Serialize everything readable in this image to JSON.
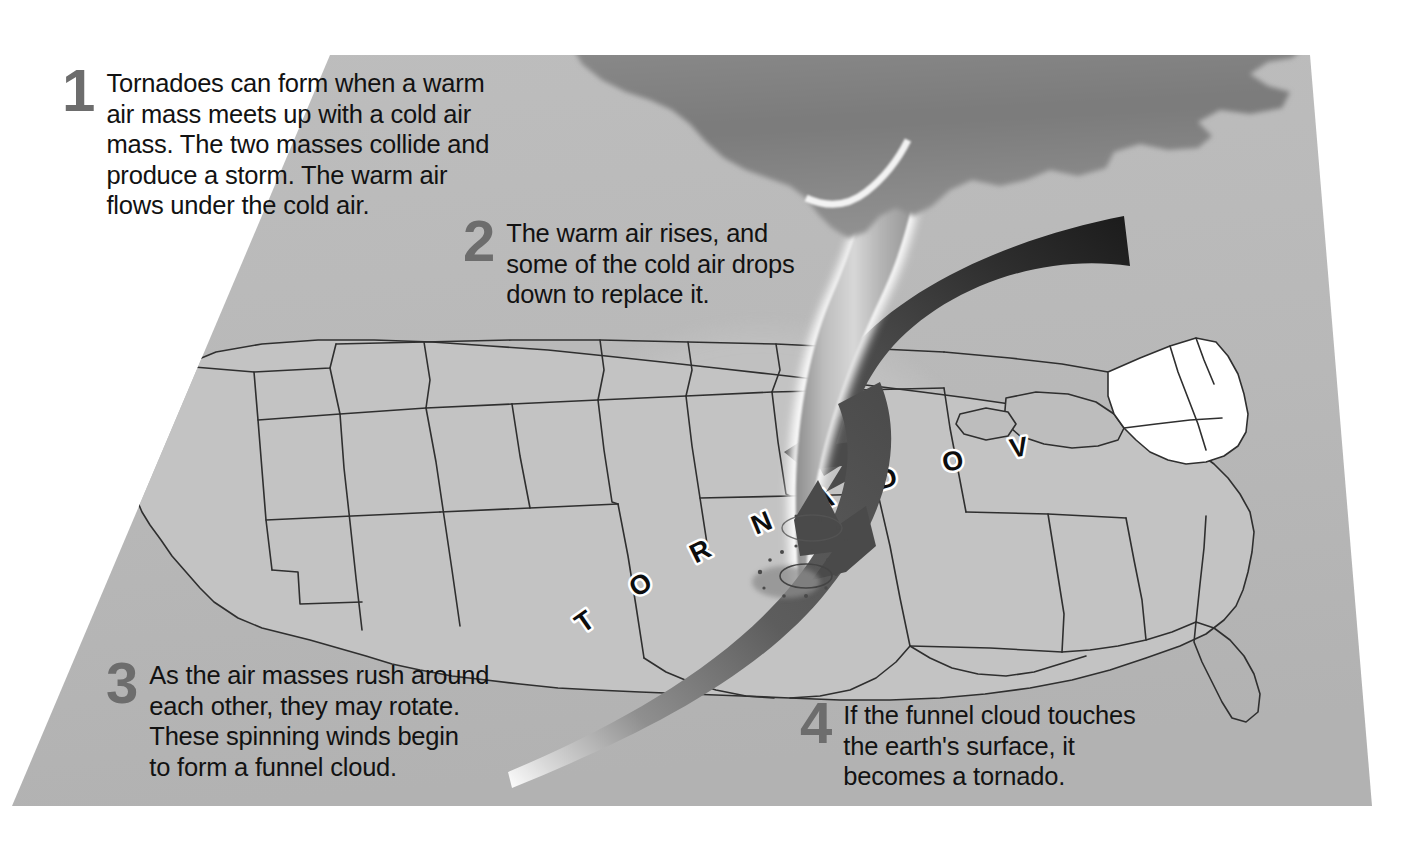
{
  "diagram": {
    "background_color": "#ffffff",
    "map_fill": "#b9b9b9",
    "map_edge": "#3a3a3a",
    "accent_dark": "#3c3c3c",
    "number_color": "#6d6d6d",
    "text_color": "#121212"
  },
  "steps": [
    {
      "number": "1",
      "text": "Tornadoes can form when a warm\nair mass meets up with a cold air\nmass. The two masses collide and\nproduce a storm. The warm air\nflows under the cold air."
    },
    {
      "number": "2",
      "text": "The warm air rises, and\nsome of the cold air drops\ndown to replace it."
    },
    {
      "number": "3",
      "text": "As the air masses rush around\neach other, they may rotate.\nThese spinning winds begin\nto form a funnel cloud."
    },
    {
      "number": "4",
      "text": "If the funnel cloud touches\nthe earth's surface, it\nbecomes a tornado."
    }
  ],
  "map_label": {
    "text": "TORNADO VALLEY",
    "letters": [
      "T",
      "O",
      "R",
      "N",
      "A",
      "D",
      "O",
      "V",
      "A",
      "L",
      "L",
      "E",
      "Y"
    ],
    "style": "curved-arc-outlined"
  },
  "elements": {
    "storm_cloud": "storm-cloud",
    "funnel_cloud": "funnel-cloud",
    "debris_cloud": "debris-cloud",
    "warm_air_ribbon": "warm-air-spiral-arrow",
    "cold_air_ribbon": "cold-air-spiral-arrow",
    "alley_region": "tornado-alley-shaded-region",
    "base_map": "united-states-map"
  }
}
